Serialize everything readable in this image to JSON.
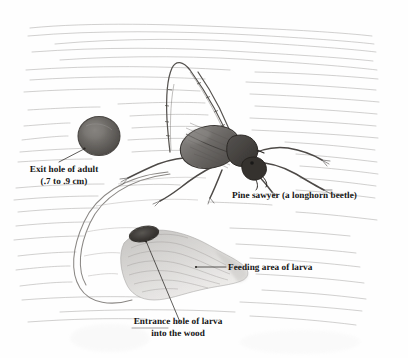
{
  "figure": {
    "medium": "pencil drawing",
    "background_color": "#fefefe",
    "ink_color": "#6b6b6b",
    "label_color": "#151515"
  },
  "labels": {
    "exit_hole": {
      "line1": "Exit hole of adult",
      "line2": "(.7 to .9 cm)"
    },
    "beetle": {
      "line1": "Pine sawyer (a longhorn beetle)"
    },
    "feeding_area": {
      "line1": "Feeding area of larva"
    },
    "entrance_hole": {
      "line1": "Entrance hole of larva",
      "line2": "into the wood"
    }
  },
  "features": {
    "exit_hole_name": "exit-hole",
    "beetle_name": "pine-sawyer-beetle",
    "feeding_area_name": "larva-feeding-area",
    "entrance_hole_name": "larva-entrance-hole",
    "wood_grain_name": "wood-grain"
  }
}
